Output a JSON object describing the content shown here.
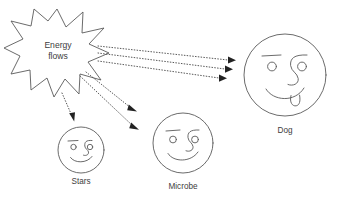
{
  "diagram": {
    "background_color": "#ffffff",
    "line_color": "#5a5a5a",
    "arrow_color": "#222222",
    "text_color": "#3d3d3d",
    "source": {
      "name": "energy-flows-burst",
      "shape": "starburst",
      "label_line_1": "Energy",
      "label_line_2": "flows",
      "points": 11,
      "center_x": 57,
      "center_y": 52
    },
    "targets": [
      {
        "name": "stars",
        "label": "Stars",
        "face": "smiley",
        "has_tongue": false,
        "center_x": 81,
        "center_y": 150,
        "radius": 23,
        "label_x": 81,
        "label_y": 182
      },
      {
        "name": "microbe",
        "label": "Microbe",
        "face": "smiley",
        "has_tongue": false,
        "center_x": 183,
        "center_y": 143,
        "radius": 30,
        "label_x": 183,
        "label_y": 187
      },
      {
        "name": "dog",
        "label": "Dog",
        "face": "smiley",
        "has_tongue": true,
        "center_x": 285,
        "center_y": 75,
        "radius": 41,
        "label_x": 285,
        "label_y": 131
      }
    ],
    "flows": [
      {
        "name": "flow-to-dog-1",
        "from": "energy-flows-burst",
        "to": "dog",
        "style": "dotted",
        "arrowhead": "solid-triangle"
      },
      {
        "name": "flow-to-dog-2",
        "from": "energy-flows-burst",
        "to": "dog",
        "style": "dotted",
        "arrowhead": "solid-triangle"
      },
      {
        "name": "flow-to-dog-3",
        "from": "energy-flows-burst",
        "to": "dog",
        "style": "dotted",
        "arrowhead": "solid-triangle"
      },
      {
        "name": "flow-to-microbe-1",
        "from": "energy-flows-burst",
        "to": "microbe",
        "style": "dotted",
        "arrowhead": "solid-triangle"
      },
      {
        "name": "flow-to-microbe-2",
        "from": "energy-flows-burst",
        "to": "microbe",
        "style": "dotted",
        "arrowhead": "solid-triangle"
      },
      {
        "name": "flow-to-stars-1",
        "from": "energy-flows-burst",
        "to": "stars",
        "style": "dotted",
        "arrowhead": "solid-triangle"
      }
    ]
  }
}
